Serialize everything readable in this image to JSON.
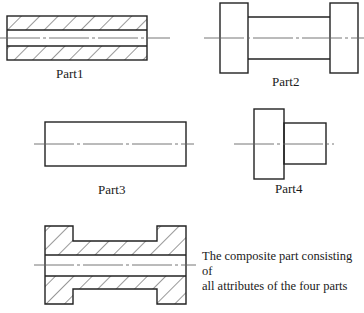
{
  "diagram": {
    "parts": [
      {
        "id": "part1",
        "label": "Part1",
        "description": "Hollow cylinder (tube) shown in section with hatching and a central bore"
      },
      {
        "id": "part2",
        "label": "Part2",
        "description": "Solid spool: two flanges joined by a narrower shaft"
      },
      {
        "id": "part3",
        "label": "Part3",
        "description": "Solid plain cylinder"
      },
      {
        "id": "part4",
        "label": "Part4",
        "description": "Stepped cylinder: one flange with a smaller shaft"
      }
    ],
    "composite": {
      "caption_line1": "The composite part consisting of",
      "caption_line2": "all attributes of the four parts",
      "description": "Hollow spool in section: two flanges, a narrower shaft and a central bore, hatched"
    },
    "colors": {
      "line": "#222222",
      "centerline": "#666666",
      "background": "#ffffff"
    }
  }
}
